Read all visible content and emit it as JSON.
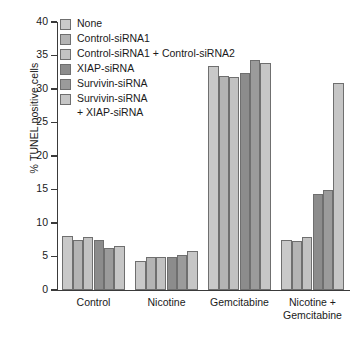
{
  "chart_data": {
    "type": "bar",
    "title": "",
    "xlabel": "",
    "ylabel": "% TUNEL positive cells",
    "ylim": [
      0,
      40
    ],
    "yticks": [
      0,
      5,
      10,
      15,
      20,
      25,
      30,
      35,
      40
    ],
    "grid": false,
    "legend_position": "top-left-inside",
    "categories": [
      "Control",
      "Nicotine",
      "Gemcitabine",
      "Nicotine +\nGemcitabine"
    ],
    "series": [
      {
        "name": "None",
        "color": "#c9c9c9",
        "values": [
          8.0,
          4.4,
          33.4,
          7.4
        ]
      },
      {
        "name": "Control-siRNA1",
        "color": "#b4b4b4",
        "values": [
          7.4,
          5.0,
          31.9,
          7.3
        ]
      },
      {
        "name": "Control-siRNA1 + Control-siRNA2",
        "color": "#c2c2c2",
        "values": [
          7.9,
          4.9,
          31.8,
          7.9
        ]
      },
      {
        "name": "XIAP-siRNA",
        "color": "#8c8c8c",
        "values": [
          7.4,
          5.0,
          32.4,
          14.4
        ]
      },
      {
        "name": "Survivin-siRNA",
        "color": "#9b9b9b",
        "values": [
          6.3,
          5.2,
          34.4,
          14.9
        ]
      },
      {
        "name": "Survivin-siRNA\n+ XIAP-siRNA",
        "color": "#c6c6c6",
        "values": [
          6.6,
          5.8,
          33.9,
          30.9
        ]
      }
    ]
  }
}
